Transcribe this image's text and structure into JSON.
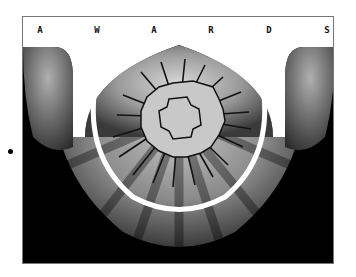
{
  "banner": {
    "letters": [
      "A",
      "W",
      "A",
      "R",
      "D",
      "S"
    ],
    "background": "#ffffff",
    "text_color": "#111111"
  },
  "artwork": {
    "description": "Stylized gear/sun emblem with radiating spikes over grey radial background, framed by a white U-shaped arc",
    "colors": {
      "background": "#000000",
      "rays": "#9a9a9a",
      "emblem_fill": "#c8c8c8",
      "outline": "#111111",
      "arc": "#ffffff"
    }
  },
  "marker": {
    "shape": "bullet"
  }
}
